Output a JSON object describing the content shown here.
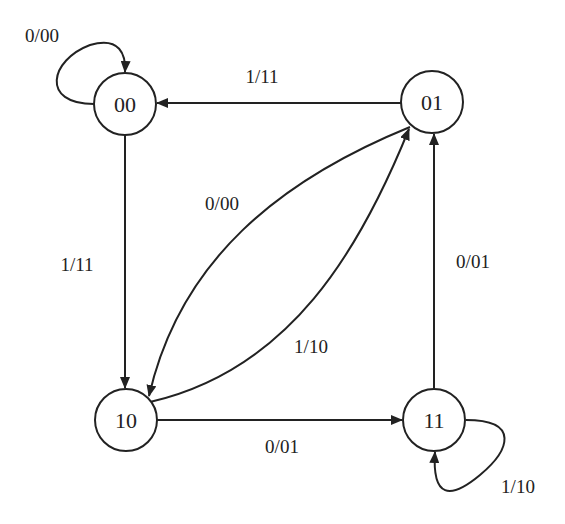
{
  "diagram": {
    "type": "state-diagram",
    "colors": {
      "stroke": "#222222",
      "background": "#ffffff"
    },
    "nodes": [
      {
        "id": "00",
        "label": "00"
      },
      {
        "id": "01",
        "label": "01"
      },
      {
        "id": "10",
        "label": "10"
      },
      {
        "id": "11",
        "label": "11"
      }
    ],
    "edges": [
      {
        "from": "00",
        "to": "00",
        "label": "0/00"
      },
      {
        "from": "01",
        "to": "00",
        "label": "1/11"
      },
      {
        "from": "00",
        "to": "10",
        "label": "1/11"
      },
      {
        "from": "01",
        "to": "10",
        "label": "0/00"
      },
      {
        "from": "10",
        "to": "01",
        "label": "1/10"
      },
      {
        "from": "10",
        "to": "11",
        "label": "0/01"
      },
      {
        "from": "11",
        "to": "01",
        "label": "0/01"
      },
      {
        "from": "11",
        "to": "11",
        "label": "1/10"
      }
    ]
  }
}
